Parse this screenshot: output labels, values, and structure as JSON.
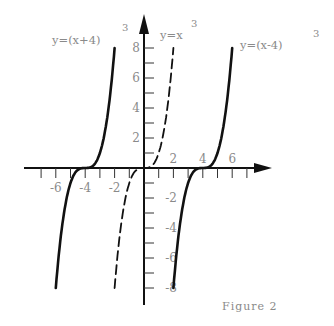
{
  "chart_data": {
    "type": "line",
    "title": "",
    "caption": "Figure 2",
    "xlabel": "",
    "ylabel": "",
    "xlim": [
      -8,
      8.5
    ],
    "ylim": [
      -9,
      9.5
    ],
    "grid": false,
    "x_ticks": [
      -7,
      -6,
      -5,
      -4,
      -3,
      -2,
      -1,
      1,
      2,
      3,
      4,
      5,
      6,
      7
    ],
    "x_tick_labels": [
      {
        "value": -6,
        "label": "-6"
      },
      {
        "value": -4,
        "label": "-4"
      },
      {
        "value": -2,
        "label": "-2"
      },
      {
        "value": 2,
        "label": "2"
      },
      {
        "value": 4,
        "label": "4"
      },
      {
        "value": 6,
        "label": "6"
      }
    ],
    "y_ticks": [
      -8,
      -7,
      -6,
      -5,
      -4,
      -3,
      -2,
      -1,
      1,
      2,
      3,
      4,
      5,
      6,
      7,
      8
    ],
    "y_tick_labels": [
      {
        "value": 8,
        "label": "8"
      },
      {
        "value": 6,
        "label": "6"
      },
      {
        "value": 4,
        "label": "4"
      },
      {
        "value": 2,
        "label": "2"
      },
      {
        "value": -2,
        "label": "-2"
      },
      {
        "value": -4,
        "label": "-4"
      },
      {
        "value": -6,
        "label": "-6"
      },
      {
        "value": -8,
        "label": "-8"
      }
    ],
    "series": [
      {
        "name": "y=(x+4)^3",
        "label_main": "y=(x+4)",
        "label_exp": "3",
        "shift": -4,
        "x_range": [
          -6,
          -2
        ],
        "style": "solid"
      },
      {
        "name": "y=x^3",
        "label_main": "y=x",
        "label_exp": "3",
        "shift": 0,
        "x_range": [
          -2,
          2
        ],
        "style": "dashed"
      },
      {
        "name": "y=(x-4)^3",
        "label_main": "y=(x-4)",
        "label_exp": "3",
        "shift": 4,
        "x_range": [
          2,
          6
        ],
        "style": "solid"
      }
    ]
  },
  "layout": {
    "origin_px": [
      144,
      168
    ],
    "x_scale": 14.7,
    "y_scale": 15.0,
    "x_axis_start_px": 24,
    "x_axis_end_px": 272,
    "y_axis_top_px": 14,
    "y_axis_bottom_px": 305,
    "line_color": "#111111",
    "text_color": "#8a8a8a"
  }
}
